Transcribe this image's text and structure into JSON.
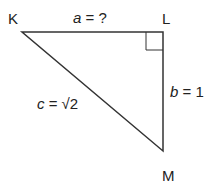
{
  "diagram": {
    "type": "right-triangle",
    "vertices": {
      "K": {
        "label": "K",
        "x": 22,
        "y": 32
      },
      "L": {
        "label": "L",
        "x": 163,
        "y": 32
      },
      "M": {
        "label": "M",
        "x": 163,
        "y": 151
      }
    },
    "right_angle_at": "L",
    "sides": {
      "a": {
        "var": "a",
        "value": " = ?"
      },
      "b": {
        "var": "b",
        "value": " = 1"
      },
      "c": {
        "var": "c",
        "value": " = √2"
      }
    },
    "stroke_color": "#333333"
  }
}
